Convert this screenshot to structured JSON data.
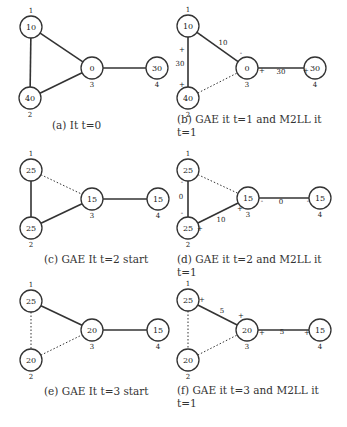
{
  "panels": [
    {
      "id": "a",
      "caption": "(a) It t=0",
      "nodes": [
        {
          "id": "1",
          "value": "10",
          "x": 31,
          "y": 27
        },
        {
          "id": "2",
          "value": "40",
          "x": 30,
          "y": 98
        },
        {
          "id": "3",
          "value": "0",
          "x": 92,
          "y": 68
        },
        {
          "id": "4",
          "value": "30",
          "x": 157,
          "y": 68
        }
      ],
      "edges": [
        {
          "from": "1",
          "to": "3",
          "style": "solid"
        },
        {
          "from": "1",
          "to": "2",
          "style": "solid"
        },
        {
          "from": "2",
          "to": "3",
          "style": "solid"
        },
        {
          "from": "3",
          "to": "4",
          "style": "solid"
        }
      ],
      "labels": []
    },
    {
      "id": "b",
      "caption": "(b) GAE it t=1 and M2LL it t=1",
      "nodes": [
        {
          "id": "1",
          "value": "10",
          "x": 188,
          "y": 26
        },
        {
          "id": "2",
          "value": "40",
          "x": 188,
          "y": 98
        },
        {
          "id": "3",
          "value": "0",
          "x": 247,
          "y": 68
        },
        {
          "id": "4",
          "value": "30",
          "x": 315,
          "y": 68
        }
      ],
      "edges": [
        {
          "from": "1",
          "to": "3",
          "style": "solid"
        },
        {
          "from": "1",
          "to": "2",
          "style": "solid"
        },
        {
          "from": "2",
          "to": "3",
          "style": "dotted"
        },
        {
          "from": "3",
          "to": "4",
          "style": "solid"
        }
      ],
      "labels": [
        {
          "t": "10",
          "x": 223,
          "y": 45
        },
        {
          "t": "30",
          "x": 180,
          "y": 66
        },
        {
          "t": "30",
          "x": 281,
          "y": 74
        },
        {
          "t": "-",
          "x": 201,
          "y": 37
        },
        {
          "t": "+",
          "x": 182,
          "y": 52
        },
        {
          "t": "-",
          "x": 241,
          "y": 55
        },
        {
          "t": "+",
          "x": 182,
          "y": 87
        },
        {
          "t": "+",
          "x": 262,
          "y": 73
        },
        {
          "t": "+",
          "x": 306,
          "y": 73
        }
      ]
    },
    {
      "id": "c",
      "caption": "(c) GAE It t=2 start",
      "nodes": [
        {
          "id": "1",
          "value": "25",
          "x": 31,
          "y": 170
        },
        {
          "id": "2",
          "value": "25",
          "x": 31,
          "y": 228
        },
        {
          "id": "3",
          "value": "15",
          "x": 92,
          "y": 199
        },
        {
          "id": "4",
          "value": "15",
          "x": 158,
          "y": 199
        }
      ],
      "edges": [
        {
          "from": "1",
          "to": "3",
          "style": "dotted"
        },
        {
          "from": "1",
          "to": "2",
          "style": "solid"
        },
        {
          "from": "2",
          "to": "3",
          "style": "solid"
        },
        {
          "from": "3",
          "to": "4",
          "style": "solid"
        }
      ],
      "labels": []
    },
    {
      "id": "d",
      "caption": "(d) GAE it t=2 and M2LL it t=1",
      "nodes": [
        {
          "id": "1",
          "value": "25",
          "x": 188,
          "y": 170
        },
        {
          "id": "2",
          "value": "25",
          "x": 188,
          "y": 228
        },
        {
          "id": "3",
          "value": "15",
          "x": 248,
          "y": 198
        },
        {
          "id": "4",
          "value": "15",
          "x": 320,
          "y": 198
        }
      ],
      "edges": [
        {
          "from": "1",
          "to": "3",
          "style": "dotted"
        },
        {
          "from": "1",
          "to": "2",
          "style": "solid"
        },
        {
          "from": "2",
          "to": "3",
          "style": "solid"
        },
        {
          "from": "3",
          "to": "4",
          "style": "solid"
        }
      ],
      "labels": [
        {
          "t": "0",
          "x": 181,
          "y": 199
        },
        {
          "t": "10",
          "x": 221,
          "y": 222
        },
        {
          "t": "0",
          "x": 281,
          "y": 204
        },
        {
          "t": "-",
          "x": 182,
          "y": 184
        },
        {
          "t": "-",
          "x": 182,
          "y": 215
        },
        {
          "t": "+",
          "x": 200,
          "y": 231
        },
        {
          "t": "+",
          "x": 240,
          "y": 211
        },
        {
          "t": "-",
          "x": 262,
          "y": 203
        },
        {
          "t": "-",
          "x": 308,
          "y": 203
        }
      ]
    },
    {
      "id": "e",
      "caption": "(e) GAE It t=3 start",
      "nodes": [
        {
          "id": "1",
          "value": "25",
          "x": 31,
          "y": 301
        },
        {
          "id": "2",
          "value": "20",
          "x": 31,
          "y": 360
        },
        {
          "id": "3",
          "value": "20",
          "x": 92,
          "y": 330
        },
        {
          "id": "4",
          "value": "15",
          "x": 158,
          "y": 330
        }
      ],
      "edges": [
        {
          "from": "1",
          "to": "3",
          "style": "solid"
        },
        {
          "from": "1",
          "to": "2",
          "style": "dotted"
        },
        {
          "from": "2",
          "to": "3",
          "style": "dotted"
        },
        {
          "from": "3",
          "to": "4",
          "style": "solid"
        }
      ],
      "labels": []
    },
    {
      "id": "f",
      "caption": "(f) GAE it t=3 and M2LL it t=1",
      "nodes": [
        {
          "id": "1",
          "value": "25",
          "x": 188,
          "y": 300
        },
        {
          "id": "2",
          "value": "20",
          "x": 188,
          "y": 360
        },
        {
          "id": "3",
          "value": "20",
          "x": 247,
          "y": 330
        },
        {
          "id": "4",
          "value": "15",
          "x": 320,
          "y": 330
        }
      ],
      "edges": [
        {
          "from": "1",
          "to": "3",
          "style": "solid"
        },
        {
          "from": "1",
          "to": "2",
          "style": "dotted"
        },
        {
          "from": "2",
          "to": "3",
          "style": "dotted"
        },
        {
          "from": "3",
          "to": "4",
          "style": "solid"
        }
      ],
      "labels": [
        {
          "t": "+",
          "x": 202,
          "y": 302
        },
        {
          "t": "5",
          "x": 222,
          "y": 313
        },
        {
          "t": "+",
          "x": 241,
          "y": 318
        },
        {
          "t": "+",
          "x": 262,
          "y": 335
        },
        {
          "t": "5",
          "x": 282,
          "y": 334
        },
        {
          "t": "+",
          "x": 307,
          "y": 335
        }
      ]
    }
  ],
  "caption_positions": {
    "a": {
      "x": 52,
      "y": 119
    },
    "b": {
      "x": 177,
      "y": 119
    },
    "c": {
      "x": 44,
      "y": 259
    },
    "d": {
      "x": 177,
      "y": 259
    },
    "e": {
      "x": 44,
      "y": 390
    },
    "f": {
      "x": 177,
      "y": 390
    }
  }
}
